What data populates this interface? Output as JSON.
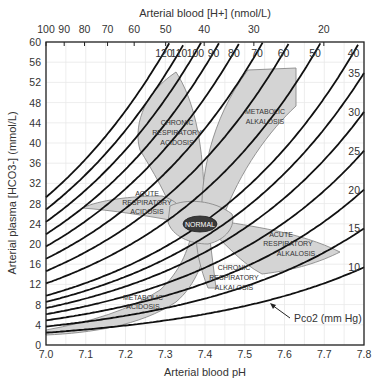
{
  "chart_data": {
    "type": "area",
    "title": "",
    "xlabel": "Arterial blood pH",
    "ylabel": "Arterial plasma [HCO3-] (mmol/L)",
    "x2label": "Arterial blood [H+] (nmol/L)",
    "xlim": [
      7.0,
      7.8
    ],
    "ylim": [
      0,
      60
    ],
    "grid": true,
    "x_ticks": [
      "7.0",
      "7.1",
      "7.2",
      "7.3",
      "7.4",
      "7.5",
      "7.6",
      "7.7",
      "7.8"
    ],
    "y_ticks": [
      "0",
      "4",
      "8",
      "12",
      "16",
      "20",
      "24",
      "28",
      "32",
      "36",
      "40",
      "44",
      "48",
      "52",
      "56",
      "60"
    ],
    "top_ticks": [
      "100",
      "90",
      "80",
      "70",
      "60",
      "50",
      "40",
      "30",
      "20"
    ],
    "isopleth_label": "Pco2 (mm Hg)",
    "isopleths_pco2": [
      120,
      110,
      100,
      90,
      80,
      70,
      60,
      50,
      40,
      35,
      30,
      25,
      20,
      15,
      10
    ],
    "top_isopleth_labels": [
      "120",
      "110",
      "100",
      "90",
      "80",
      "70",
      "60",
      "50",
      "40"
    ],
    "right_isopleth_labels": [
      "35",
      "30",
      "25",
      "20",
      "15",
      "10"
    ],
    "regions": [
      {
        "name": "CHRONIC RESPIRATORY ACIDOSIS",
        "lines": [
          "CHRONIC",
          "RESPIRATORY",
          "ACIDOSIS"
        ]
      },
      {
        "name": "METABOLIC ALKALOSIS",
        "lines": [
          "METABOLIC",
          "ALKALOSIS"
        ]
      },
      {
        "name": "ACUTE RESPIRATORY ACIDOSIS",
        "lines": [
          "ACUTE",
          "RESPIRATORY",
          "ACIDOSIS"
        ]
      },
      {
        "name": "NORMAL",
        "lines": [
          "NORMAL"
        ],
        "center": {
          "pH": 7.39,
          "HCO3": 24
        }
      },
      {
        "name": "ACUTE RESPIRATORY ALKALOSIS",
        "lines": [
          "ACUTE",
          "RESPIRATORY",
          "ALKALOSIS"
        ]
      },
      {
        "name": "CHRONIC RESPIRATORY ALKALOSIS",
        "lines": [
          "CHRONIC",
          "RESPIRATORY",
          "ALKALOSIS"
        ]
      },
      {
        "name": "METABOLIC ACIDOSIS",
        "lines": [
          "METABOLIC",
          "ACIDOSIS"
        ]
      }
    ],
    "colors": {
      "region_fill": "#d4d4d4",
      "region_stroke": "#8a8a8a",
      "normal_fill": "#3a3a3a",
      "isopleth": "#111111",
      "grid": "#e6e6e6"
    }
  }
}
